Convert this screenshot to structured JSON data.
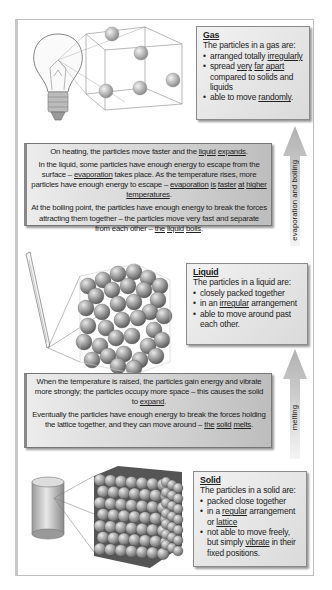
{
  "gas": {
    "title": "Gas",
    "intro": "The particles in a gas are:",
    "points": [
      [
        "arranged totally ",
        {
          "u": "irregularly"
        }
      ],
      [
        "spread ",
        {
          "u": "very"
        },
        " ",
        {
          "u": "far"
        },
        " ",
        {
          "u": "apart"
        },
        " compared to solids and liquids"
      ],
      [
        "able to move ",
        {
          "u": "randomly"
        },
        "."
      ]
    ]
  },
  "heating_paragraphs": [
    [
      "On heating, the particles move faster and the ",
      {
        "u": "liquid"
      },
      " ",
      {
        "u": "expands"
      },
      "."
    ],
    [
      "In the liquid, some particles have enough energy to escape from the surface – ",
      {
        "u": "evaporation"
      },
      " takes place. As the temperature rises, more particles have enough energy to escape – ",
      {
        "u": "evaporation"
      },
      " ",
      {
        "u": "is"
      },
      " ",
      {
        "u": "faster"
      },
      " ",
      {
        "u": "at"
      },
      " ",
      {
        "u": "higher"
      },
      " ",
      {
        "u": "temperatures"
      },
      "."
    ],
    [
      "At the boiling point, the particles have enough energy to break the forces attracting them together – the particles move very fast and separate from each other – ",
      {
        "u": "the"
      },
      " ",
      {
        "u": "liquid"
      },
      " ",
      {
        "u": "boils"
      },
      "."
    ]
  ],
  "liquid": {
    "title": "Liquid",
    "intro": "The particles in a liquid are:",
    "points": [
      [
        "closely packed together"
      ],
      [
        "in an ",
        {
          "u": "irregular"
        },
        " arrangement"
      ],
      [
        "able to move around past each other."
      ]
    ]
  },
  "melting_paragraphs": [
    [
      "When the temperature is raised, the particles gain energy and vibrate more strongly; the particles occupy more space – this causes the solid to ",
      {
        "u": "expand"
      },
      "."
    ],
    [
      "Eventually the particles have enough energy to break the forces holding the lattice together, and they can move around – ",
      {
        "u": "the"
      },
      " ",
      {
        "u": "solid"
      },
      " ",
      {
        "u": "melts"
      },
      "."
    ]
  ],
  "solid": {
    "title": "Solid",
    "intro": "The particles in a solid are:",
    "points": [
      [
        "packed close together"
      ],
      [
        "in a ",
        {
          "u": "regular"
        },
        " arrangement or ",
        {
          "u": "lattice"
        }
      ],
      [
        "not able to move freely, but simply ",
        {
          "u": "vibrate"
        },
        " in their fixed positions."
      ]
    ]
  },
  "arrows": {
    "upper_label": "evaporation and boiling",
    "lower_label": "melting"
  },
  "images": {
    "gas_object": "light-bulb-icon",
    "liquid_object": "thermometer-icon",
    "solid_object": "metal-cylinder-icon"
  },
  "colors": {
    "box_light": "#f0f0f0",
    "box_dark": "#c0c0c0",
    "arrow": "#b8b8b8",
    "particle": "#8c8c8c"
  }
}
